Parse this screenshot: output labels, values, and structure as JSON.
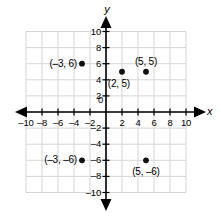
{
  "chart_data": {
    "type": "scatter",
    "title": "",
    "xlabel": "x",
    "ylabel": "y",
    "xlim": [
      -10,
      10
    ],
    "ylim": [
      -10,
      10
    ],
    "grid": true,
    "grid_step": 2,
    "legend": "none",
    "origin_label": "0",
    "x_ticks": [
      -10,
      -8,
      -6,
      -4,
      -2,
      2,
      4,
      6,
      8,
      10
    ],
    "y_ticks": [
      10,
      8,
      6,
      4,
      2,
      -2,
      -4,
      -6,
      -8,
      -10
    ],
    "x_tick_labels": [
      "–10",
      "–8",
      "–6",
      "–4",
      "–2",
      "2",
      "4",
      "6",
      "8",
      "10"
    ],
    "y_tick_labels": [
      "10",
      "8",
      "6",
      "4",
      "2",
      "–2",
      "–4",
      "–6",
      "–8",
      "–10"
    ],
    "points": [
      {
        "x": -3,
        "y": 6,
        "label": "(–3, 6)",
        "label_pos": "left"
      },
      {
        "x": 2,
        "y": 5,
        "label": "(2, 5)",
        "label_pos": "below-left"
      },
      {
        "x": 5,
        "y": 5,
        "label": "(5, 5)",
        "label_pos": "above"
      },
      {
        "x": -3,
        "y": -6,
        "label": "(–3, –6)",
        "label_pos": "left"
      },
      {
        "x": 5,
        "y": -6,
        "label": "(5, –6)",
        "label_pos": "below"
      }
    ],
    "colors": {
      "background": "#ffffff",
      "grid": "#d5d5d5",
      "axis": "#000000",
      "point": "#111111",
      "text": "#000000"
    }
  }
}
